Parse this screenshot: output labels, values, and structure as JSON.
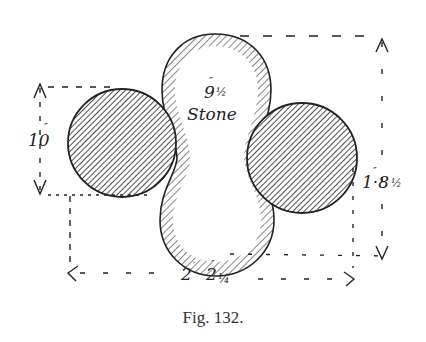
{
  "figure": {
    "caption": "Fig. 132.",
    "stone_label": {
      "size": "9½″",
      "size_whole": "9",
      "size_frac": "½",
      "size_mark": "″",
      "name": "Stone"
    },
    "dimensions": {
      "left_height": {
        "text": "10″",
        "value": "10",
        "mark": "″"
      },
      "right_height": {
        "text": "1·8½″",
        "value": "1·8",
        "frac": "½",
        "mark": "″"
      },
      "bottom_width": {
        "text": "2′ 2¼″",
        "feet": "2",
        "feet_mark": "′",
        "inches": "2",
        "frac": "¼",
        "inch_mark": "″"
      }
    },
    "shapes": {
      "stone": "peanut-shaped hatched outline (vertical)",
      "left_ball": "hatched circle",
      "right_ball": "hatched circle"
    },
    "colors": {
      "ink": "#222222",
      "background": "#ffffff"
    }
  }
}
